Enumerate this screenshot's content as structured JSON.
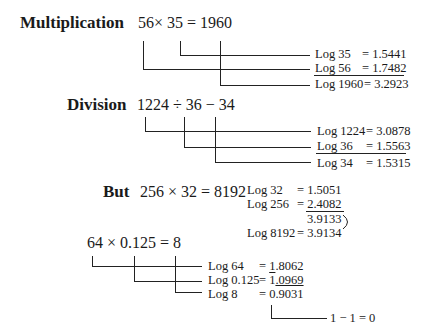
{
  "multiplication": {
    "label": "Multiplication",
    "equation": "56× 35  = 1960",
    "logs": [
      {
        "label": "Log 35",
        "value": "= 1.5441"
      },
      {
        "label": "Log 56",
        "value": "= 1.7482"
      },
      {
        "label": "Log 1960",
        "value": "= 3.2923"
      }
    ]
  },
  "division": {
    "label": "Division",
    "equation": "1224 ÷ 36 − 34",
    "logs": [
      {
        "label": "Log 1224",
        "value": "= 3.0878"
      },
      {
        "label": "Log 36",
        "value": "= 1.5563"
      },
      {
        "label": "Log 34",
        "value": "= 1.5315"
      }
    ]
  },
  "but": {
    "label": "But",
    "equation": "256 × 32 = 8192",
    "logs": [
      {
        "label": "Log 32",
        "value": "= 1.5051"
      },
      {
        "label": "Log 256",
        "value": "= 2.4082"
      },
      {
        "label": "",
        "value": "3.9133"
      },
      {
        "label": "Log 8192",
        "value": "= 3.9134"
      }
    ]
  },
  "fraction_example": {
    "equation": "64 × 0.125 = 8",
    "logs": [
      {
        "label": "Log 64",
        "value": "= 1.8062"
      },
      {
        "label": "Log 0.125",
        "value_prefix": "= ",
        "bar_digit": "1",
        "value_rest": ".0969"
      },
      {
        "label": "Log 8",
        "value_prefix": "= ",
        "value_over": "0.9031"
      }
    ],
    "result": "1 − 1 = 0"
  }
}
